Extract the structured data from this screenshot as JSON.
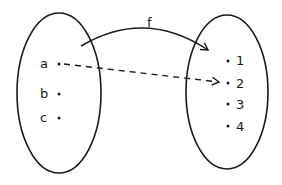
{
  "diagram": {
    "type": "function-mapping",
    "function_label": "f",
    "domain_set": {
      "elements": [
        "a",
        "b",
        "c"
      ]
    },
    "codomain_set": {
      "elements": [
        "1",
        "2",
        "3",
        "4"
      ]
    },
    "mappings": [
      {
        "from": "a",
        "to": "2",
        "style": "dashed"
      }
    ],
    "arrows": [
      {
        "label": "f",
        "from": "domain-set",
        "to": "codomain-set",
        "style": "solid-curved"
      }
    ],
    "colors": {
      "stroke": "#1a1a1a",
      "background": "#ffffff"
    }
  }
}
